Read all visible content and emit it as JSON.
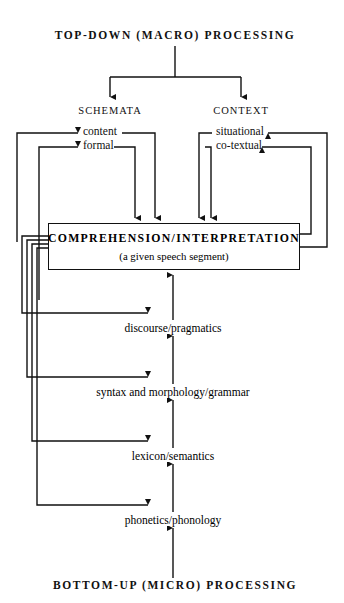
{
  "diagram": {
    "title_top": "TOP-DOWN (MACRO) PROCESSING",
    "title_bottom": "BOTTOM-UP (MICRO) PROCESSING",
    "branches": [
      {
        "name": "SCHEMATA",
        "x": 110
      },
      {
        "name": "CONTEXT",
        "x": 241
      }
    ],
    "schemata_nodes": [
      {
        "label": "content"
      },
      {
        "label": "formal"
      }
    ],
    "context_nodes": [
      {
        "label": "situational"
      },
      {
        "label": "co-textual"
      }
    ],
    "center_box": {
      "title": "COMPREHENSION/INTERPRETATION",
      "subtitle": "(a given speech segment)"
    },
    "tiers": [
      {
        "label": "discourse/pragmatics"
      },
      {
        "label": "syntax and morphology/grammar"
      },
      {
        "label": "lexicon/semantics"
      },
      {
        "label": "phonetics/phonology"
      }
    ],
    "colors": {
      "line": "#111111",
      "background": "#ffffff",
      "text": "#111111"
    }
  }
}
